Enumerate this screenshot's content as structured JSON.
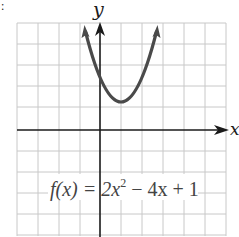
{
  "figure": {
    "type": "function-graph",
    "corner_mark": ":",
    "axes": {
      "x_label": "x",
      "y_label": "y",
      "x_range": [
        -4,
        6
      ],
      "y_range": [
        -5,
        5
      ],
      "grid_step": 1
    },
    "function": {
      "label_prefix": "f(x) = 2x",
      "label_exp": "2",
      "label_suffix": " − 4x + 1",
      "expression": "2x^2 - 4x + 1",
      "vertex": [
        1,
        -1
      ],
      "x_intercepts": [
        0.293,
        1.707
      ],
      "y_intercept": 1
    },
    "colors": {
      "grid": "#c8c8c8",
      "axis": "#1a1a1a",
      "curve": "#4a4a4a",
      "label": "#444444"
    }
  }
}
